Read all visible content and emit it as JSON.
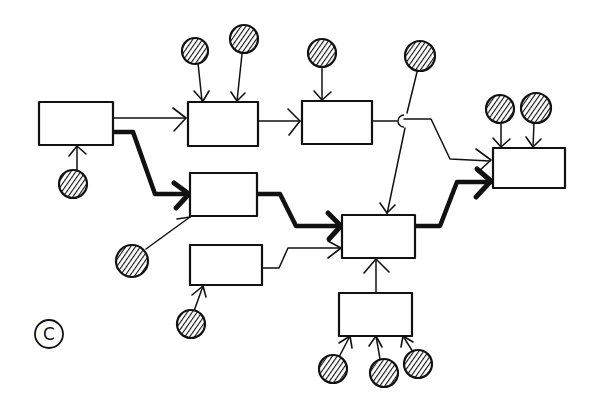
{
  "diagram": {
    "title": "",
    "style": "hand-drawn process flow sketch",
    "colors": {
      "ink": "#111111",
      "background": "#ffffff"
    },
    "nodes": [
      {
        "id": "A",
        "type": "process",
        "label": ""
      },
      {
        "id": "B",
        "type": "process",
        "label": ""
      },
      {
        "id": "C",
        "type": "process",
        "label": ""
      },
      {
        "id": "D",
        "type": "process",
        "label": ""
      },
      {
        "id": "E",
        "type": "process",
        "label": ""
      },
      {
        "id": "F",
        "type": "process",
        "label": ""
      },
      {
        "id": "G",
        "type": "process",
        "label": ""
      },
      {
        "id": "H",
        "type": "process",
        "label": ""
      }
    ],
    "resources": [
      {
        "id": "r1",
        "feeds": "A"
      },
      {
        "id": "r2",
        "feeds": "B"
      },
      {
        "id": "r3",
        "feeds": "B"
      },
      {
        "id": "r4",
        "feeds": "C"
      },
      {
        "id": "r5",
        "feeds": "F",
        "note": "line crosses C->H edge with a hop"
      },
      {
        "id": "r6",
        "feeds": "H"
      },
      {
        "id": "r7",
        "feeds": "H"
      },
      {
        "id": "r8",
        "feeds": "D"
      },
      {
        "id": "r9",
        "feeds": "E"
      },
      {
        "id": "r10",
        "feeds": "G"
      },
      {
        "id": "r11",
        "feeds": "G"
      },
      {
        "id": "r12",
        "feeds": "G"
      }
    ],
    "edges": [
      {
        "from": "A",
        "to": "B",
        "weight": "normal"
      },
      {
        "from": "B",
        "to": "C",
        "weight": "normal"
      },
      {
        "from": "C",
        "to": "H",
        "weight": "normal"
      },
      {
        "from": "A",
        "to": "D",
        "weight": "critical"
      },
      {
        "from": "D",
        "to": "F",
        "weight": "critical"
      },
      {
        "from": "E",
        "to": "F",
        "weight": "normal"
      },
      {
        "from": "G",
        "to": "F",
        "weight": "normal"
      },
      {
        "from": "F",
        "to": "H",
        "weight": "critical"
      }
    ],
    "legend": {
      "critical_path": "thick line",
      "normal": "thin line",
      "resource": "hatched circle"
    },
    "corner_mark": "C"
  }
}
